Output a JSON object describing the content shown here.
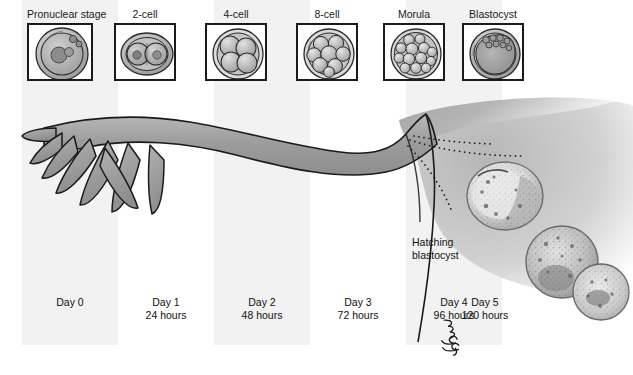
{
  "figure": {
    "width": 633,
    "height": 375,
    "background": "#ffffff"
  },
  "colors": {
    "band": "#f2f2f2",
    "tube_fill": "#9a9a9a",
    "tube_outline": "#1a1a1a",
    "uterus_fill": "#a8a8a8",
    "box_border": "#1a1a1a",
    "text": "#111111",
    "embryo_light": "#d8d8d8",
    "embryo_mid": "#b0b0b0",
    "embryo_dark": "#777777"
  },
  "stages": [
    {
      "id": "pronuclear",
      "label": "Pronuclear stage",
      "icon": "pronuclear-embryo-icon",
      "x": 27,
      "box_w": 66,
      "box_h": 58
    },
    {
      "id": "two-cell",
      "label": "2-cell",
      "icon": "two-cell-embryo-icon",
      "x": 114,
      "box_w": 62,
      "box_h": 58
    },
    {
      "id": "four-cell",
      "label": "4-cell",
      "icon": "four-cell-embryo-icon",
      "x": 205,
      "box_w": 62,
      "box_h": 58
    },
    {
      "id": "eight-cell",
      "label": "8-cell",
      "icon": "eight-cell-embryo-icon",
      "x": 296,
      "box_w": 62,
      "box_h": 58
    },
    {
      "id": "morula",
      "label": "Morula",
      "icon": "morula-embryo-icon",
      "x": 383,
      "box_w": 62,
      "box_h": 58
    },
    {
      "id": "blastocyst",
      "label": "Blastocyst",
      "icon": "blastocyst-embryo-icon",
      "x": 462,
      "box_w": 62,
      "box_h": 58
    }
  ],
  "timeline": [
    {
      "id": "day0",
      "day": "Day 0",
      "hours": "",
      "x": 22,
      "w": 96
    },
    {
      "id": "day1",
      "day": "Day 1",
      "hours": "24 hours",
      "x": 118,
      "w": 96
    },
    {
      "id": "day2",
      "day": "Day 2",
      "hours": "48 hours",
      "x": 214,
      "w": 96
    },
    {
      "id": "day3",
      "day": "Day 3",
      "hours": "72 hours",
      "x": 310,
      "w": 96
    },
    {
      "id": "day4",
      "day": "Day 4",
      "hours": "96 hours",
      "x": 406,
      "w": 96
    },
    {
      "id": "day5",
      "day": "Day 5",
      "hours": "120 hours",
      "x": 437,
      "w": 96
    }
  ],
  "bands": [
    {
      "x": 22,
      "w": 96
    },
    {
      "x": 214,
      "w": 96
    },
    {
      "x": 406,
      "w": 96
    }
  ],
  "annotations": {
    "hatching": {
      "line1": "Hatching",
      "line2": "blastocyst",
      "x": 412,
      "y": 236
    },
    "signature": "mcg"
  }
}
